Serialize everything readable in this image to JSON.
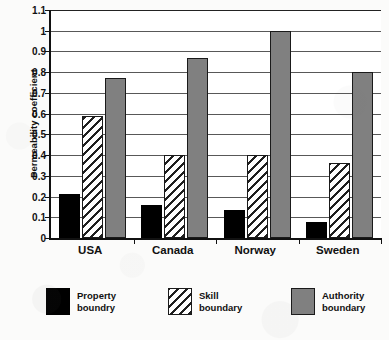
{
  "chart_data": {
    "type": "bar",
    "title": "",
    "xlabel": "",
    "ylabel": "Permeability coefficient",
    "categories": [
      "USA",
      "Canada",
      "Norway",
      "Sweden"
    ],
    "series": [
      {
        "name": "Property boundry",
        "color": "#000000",
        "fill": "solid-black",
        "values": [
          0.21,
          0.16,
          0.135,
          0.075
        ]
      },
      {
        "name": "Skill boundary",
        "color": "#ffffff",
        "fill": "diagonal-hatch",
        "values": [
          0.59,
          0.4,
          0.4,
          0.36
        ]
      },
      {
        "name": "Authority boundary",
        "color": "#808080",
        "fill": "solid-gray",
        "values": [
          0.77,
          0.87,
          1.0,
          0.8
        ]
      }
    ],
    "ylim": [
      0,
      1.1
    ],
    "ytick_step": 0.1,
    "ytick_labels": [
      "1.1",
      "1",
      "0.9",
      "0.8",
      "0.7",
      "0.6",
      "0.5",
      "0.4",
      "0.3",
      "0.2",
      "0.1",
      "0"
    ],
    "grid": true,
    "grid_axis": "y",
    "legend_position": "bottom",
    "legend": [
      {
        "label_line1": "Property",
        "label_line2": "boundry"
      },
      {
        "label_line1": "Skill",
        "label_line2": "boundary"
      },
      {
        "label_line1": "Authority",
        "label_line2": "boundary"
      }
    ]
  }
}
